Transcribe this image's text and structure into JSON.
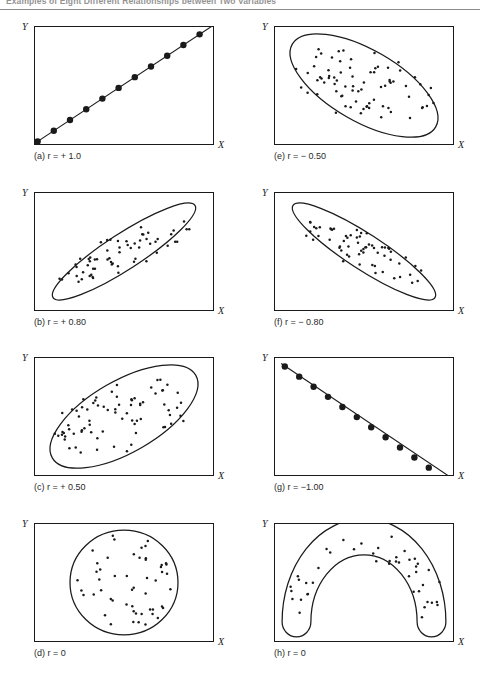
{
  "figure": {
    "title": "Examples of Eight Different Relationships between Two Variables",
    "axis_x_label": "X",
    "axis_y_label": "Y"
  },
  "chart_data": {
    "type": "scatter",
    "title": "Examples of Eight Different Relationships between Two Variables",
    "xlabel": "X",
    "ylabel": "Y",
    "grid": false,
    "legend": "none",
    "xlim": [
      0,
      1
    ],
    "ylim": [
      0,
      1
    ],
    "panels": [
      {
        "id": "a",
        "caption": "(a) r = + 1.0",
        "r": 1.0,
        "r_text": "+ 1.0",
        "pattern": "perfect-positive-line",
        "envelope": "none",
        "dot_style": "large",
        "n_points": 11,
        "points": [
          [
            0.02,
            0.03
          ],
          [
            0.11,
            0.12
          ],
          [
            0.2,
            0.21
          ],
          [
            0.29,
            0.3
          ],
          [
            0.38,
            0.39
          ],
          [
            0.47,
            0.48
          ],
          [
            0.56,
            0.57
          ],
          [
            0.65,
            0.66
          ],
          [
            0.74,
            0.75
          ],
          [
            0.83,
            0.84
          ],
          [
            0.92,
            0.93
          ]
        ],
        "line": [
          [
            0.0,
            0.01
          ],
          [
            1.0,
            1.01
          ]
        ]
      },
      {
        "id": "e",
        "caption": "(e) r = − 0.50",
        "r": -0.5,
        "r_text": "− 0.50",
        "pattern": "broad-ellipse-negative",
        "envelope": "ellipse",
        "envelope_angle_deg": -30,
        "envelope_rx": 0.46,
        "envelope_ry": 0.3,
        "dot_style": "small",
        "n_points": 76
      },
      {
        "id": "b",
        "caption": "(b) r = + 0.80",
        "r": 0.8,
        "r_text": "+ 0.80",
        "pattern": "narrow-ellipse-positive",
        "envelope": "ellipse",
        "envelope_angle_deg": 33,
        "envelope_rx": 0.47,
        "envelope_ry": 0.15,
        "dot_style": "small",
        "n_points": 62
      },
      {
        "id": "f",
        "caption": "(f) r = − 0.80",
        "r": -0.8,
        "r_text": "− 0.80",
        "pattern": "narrow-ellipse-negative",
        "envelope": "ellipse",
        "envelope_angle_deg": -33,
        "envelope_rx": 0.47,
        "envelope_ry": 0.15,
        "dot_style": "small",
        "n_points": 62
      },
      {
        "id": "c",
        "caption": "(c) r = + 0.50",
        "r": 0.5,
        "r_text": "+ 0.50",
        "pattern": "broad-ellipse-positive",
        "envelope": "ellipse",
        "envelope_angle_deg": 30,
        "envelope_rx": 0.46,
        "envelope_ry": 0.3,
        "dot_style": "small",
        "n_points": 76
      },
      {
        "id": "g",
        "caption": "(g) r = −1.00",
        "r": -1.0,
        "r_text": "−1.00",
        "pattern": "perfect-negative-line",
        "envelope": "none",
        "dot_style": "large",
        "n_points": 11,
        "points": [
          [
            0.06,
            0.92
          ],
          [
            0.14,
            0.835
          ],
          [
            0.22,
            0.75
          ],
          [
            0.3,
            0.665
          ],
          [
            0.38,
            0.58
          ],
          [
            0.46,
            0.495
          ],
          [
            0.54,
            0.41
          ],
          [
            0.62,
            0.325
          ],
          [
            0.7,
            0.24
          ],
          [
            0.78,
            0.155
          ],
          [
            0.86,
            0.07
          ]
        ],
        "line": [
          [
            0.04,
            0.945
          ],
          [
            0.99,
            -0.02
          ]
        ]
      },
      {
        "id": "d",
        "caption": "(d) r = 0",
        "r": 0,
        "r_text": "0",
        "pattern": "circle-no-relationship",
        "envelope": "circle",
        "envelope_rx": 0.3,
        "envelope_ry": 0.44,
        "dot_style": "small",
        "n_points": 52
      },
      {
        "id": "h",
        "caption": "(h) r = 0",
        "r": 0,
        "r_text": "0",
        "pattern": "curvilinear-arch",
        "envelope": "arch",
        "dot_style": "small",
        "n_points": 44
      }
    ]
  }
}
